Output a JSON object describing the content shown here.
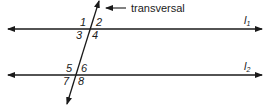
{
  "diagram": {
    "transversal_label": "transversal",
    "lines": [
      {
        "name": "l1",
        "label": "l",
        "subscript": "1"
      },
      {
        "name": "l2",
        "label": "l",
        "subscript": "2"
      }
    ],
    "angles": [
      "1",
      "2",
      "3",
      "4",
      "5",
      "6",
      "7",
      "8"
    ],
    "colors": {
      "stroke": "#1a1a1a",
      "background": "#ffffff"
    }
  }
}
